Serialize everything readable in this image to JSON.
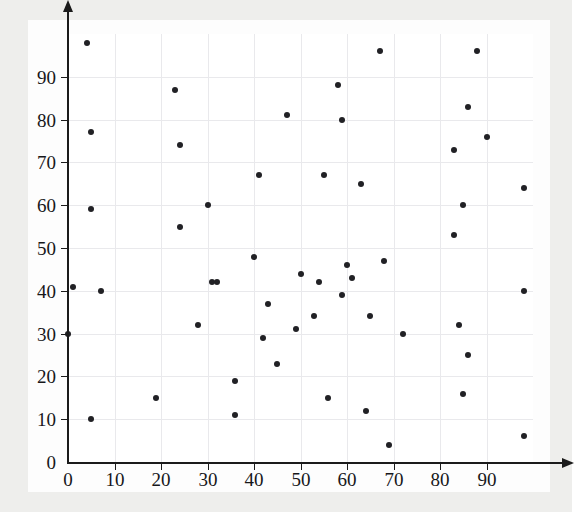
{
  "chart_data": {
    "type": "scatter",
    "title": "",
    "subtitle": "",
    "xlabel": "",
    "ylabel": "",
    "xlim": [
      0,
      100
    ],
    "ylim": [
      0,
      100
    ],
    "xticks": [
      0,
      10,
      20,
      30,
      40,
      50,
      60,
      70,
      80,
      90
    ],
    "yticks": [
      0,
      10,
      20,
      30,
      40,
      50,
      60,
      70,
      80,
      90
    ],
    "xtick_labels": [
      "0",
      "10",
      "20",
      "30",
      "40",
      "50",
      "60",
      "70",
      "80",
      "90"
    ],
    "ytick_labels": [
      "0",
      "10",
      "20",
      "30",
      "40",
      "50",
      "60",
      "70",
      "80",
      "90"
    ],
    "grid": true,
    "grid_color": "#e9e9ec",
    "legend": null,
    "legend_position": "none",
    "marker": "circle",
    "marker_color": "#212125",
    "marker_size": 6,
    "axis_color": "#1b1b1b",
    "background_color": "#ffffff",
    "page_background_color": "#eeeeec",
    "n_points": 60,
    "points": [
      {
        "x": 1,
        "y": 41
      },
      {
        "x": 0,
        "y": 30
      },
      {
        "x": 4,
        "y": 98
      },
      {
        "x": 5,
        "y": 77
      },
      {
        "x": 5,
        "y": 59
      },
      {
        "x": 5,
        "y": 10
      },
      {
        "x": 7,
        "y": 40
      },
      {
        "x": 19,
        "y": 15
      },
      {
        "x": 23,
        "y": 87
      },
      {
        "x": 24,
        "y": 74
      },
      {
        "x": 24,
        "y": 55
      },
      {
        "x": 28,
        "y": 32
      },
      {
        "x": 30,
        "y": 60
      },
      {
        "x": 31,
        "y": 42
      },
      {
        "x": 32,
        "y": 42
      },
      {
        "x": 36,
        "y": 19
      },
      {
        "x": 36,
        "y": 11
      },
      {
        "x": 40,
        "y": 48
      },
      {
        "x": 41,
        "y": 67
      },
      {
        "x": 42,
        "y": 29
      },
      {
        "x": 43,
        "y": 37
      },
      {
        "x": 45,
        "y": 23
      },
      {
        "x": 47,
        "y": 81
      },
      {
        "x": 49,
        "y": 31
      },
      {
        "x": 50,
        "y": 44
      },
      {
        "x": 53,
        "y": 34
      },
      {
        "x": 54,
        "y": 42
      },
      {
        "x": 55,
        "y": 67
      },
      {
        "x": 56,
        "y": 15
      },
      {
        "x": 58,
        "y": 88
      },
      {
        "x": 59,
        "y": 80
      },
      {
        "x": 59,
        "y": 39
      },
      {
        "x": 60,
        "y": 46
      },
      {
        "x": 61,
        "y": 43
      },
      {
        "x": 63,
        "y": 65
      },
      {
        "x": 64,
        "y": 12
      },
      {
        "x": 65,
        "y": 34
      },
      {
        "x": 67,
        "y": 96
      },
      {
        "x": 68,
        "y": 47
      },
      {
        "x": 69,
        "y": 4
      },
      {
        "x": 72,
        "y": 30
      },
      {
        "x": 83,
        "y": 73
      },
      {
        "x": 83,
        "y": 53
      },
      {
        "x": 84,
        "y": 32
      },
      {
        "x": 85,
        "y": 16
      },
      {
        "x": 85,
        "y": 60
      },
      {
        "x": 86,
        "y": 83
      },
      {
        "x": 86,
        "y": 25
      },
      {
        "x": 88,
        "y": 96
      },
      {
        "x": 90,
        "y": 76
      },
      {
        "x": 98,
        "y": 64
      },
      {
        "x": 98,
        "y": 40
      },
      {
        "x": 98,
        "y": 6
      }
    ]
  }
}
